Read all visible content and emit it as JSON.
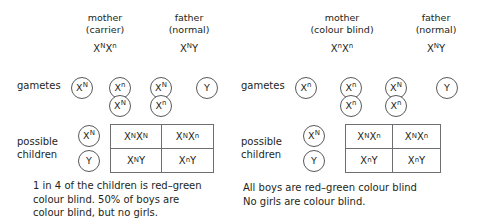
{
  "diagrams": [
    {
      "id": "carrier-mother-cross",
      "mother": {
        "title": "mother",
        "subtitle": "(carrier)",
        "genotype_X": "X",
        "genotype_sup1": "N",
        "genotype_X2": "X",
        "genotype_sup2": "n",
        "genotype_text": "XNXn"
      },
      "father": {
        "title": "father",
        "subtitle": "(normal)",
        "genotype_text": "XNY"
      },
      "rows": {
        "gametes_label": "gametes",
        "children_label_line1": "possible",
        "children_label_line2": "children"
      },
      "gametes": {
        "mother": [
          {
            "base": "X",
            "sup": "N"
          },
          {
            "base": "X",
            "sup": "n"
          },
          {
            "base": "X",
            "sup": "N"
          }
        ],
        "father": [
          {
            "base": "X",
            "sup": "N"
          },
          {
            "base": "Y",
            "sup": ""
          },
          {
            "base": "X",
            "sup": "n"
          }
        ]
      },
      "children_gametes": [
        {
          "base": "X",
          "sup": "N"
        },
        {
          "base": "Y",
          "sup": ""
        }
      ],
      "punnett": [
        [
          {
            "parts": [
              [
                "X",
                "N"
              ],
              [
                "X",
                "N"
              ]
            ]
          },
          {
            "parts": [
              [
                "X",
                "N"
              ],
              [
                "X",
                "n"
              ]
            ]
          }
        ],
        [
          {
            "parts": [
              [
                "X",
                "N"
              ],
              [
                "Y",
                ""
              ]
            ]
          },
          {
            "parts": [
              [
                "X",
                "n"
              ],
              [
                "Y",
                ""
              ]
            ]
          }
        ]
      ],
      "caption": [
        "1 in 4 of the children is red–green",
        "colour blind. 50% of boys are",
        "colour blind, but no girls."
      ]
    },
    {
      "id": "colour-blind-mother-cross",
      "mother": {
        "title": "mother",
        "subtitle": "(colour blind)",
        "genotype_text": "XnXn"
      },
      "father": {
        "title": "father",
        "subtitle": "(normal)",
        "genotype_text": "XNY"
      },
      "rows": {
        "gametes_label": "gametes",
        "children_label_line1": "possible",
        "children_label_line2": "children"
      },
      "gametes": {
        "mother": [
          {
            "base": "X",
            "sup": "n"
          },
          {
            "base": "X",
            "sup": "n"
          },
          {
            "base": "X",
            "sup": "n"
          }
        ],
        "father": [
          {
            "base": "X",
            "sup": "N"
          },
          {
            "base": "Y",
            "sup": ""
          },
          {
            "base": "X",
            "sup": "n"
          }
        ]
      },
      "children_gametes": [
        {
          "base": "X",
          "sup": "N"
        },
        {
          "base": "Y",
          "sup": ""
        }
      ],
      "punnett": [
        [
          {
            "parts": [
              [
                "X",
                "N"
              ],
              [
                "X",
                "n"
              ]
            ]
          },
          {
            "parts": [
              [
                "X",
                "N"
              ],
              [
                "X",
                "n"
              ]
            ]
          }
        ],
        [
          {
            "parts": [
              [
                "X",
                "n"
              ],
              [
                "Y",
                ""
              ]
            ]
          },
          {
            "parts": [
              [
                "X",
                "n"
              ],
              [
                "Y",
                ""
              ]
            ]
          }
        ]
      ],
      "caption": [
        "All boys are red–green colour blind",
        "No girls are colour blind."
      ]
    }
  ],
  "colors": {
    "text": "#231f20",
    "stroke": "#58595b",
    "grid": "#6d6e71",
    "background": "#ffffff"
  }
}
